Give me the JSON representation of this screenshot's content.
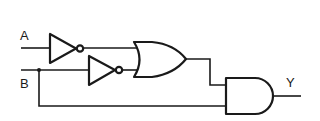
{
  "diagram": {
    "type": "logic-circuit",
    "inputs": [
      {
        "id": "A",
        "label": "A"
      },
      {
        "id": "B",
        "label": "B"
      }
    ],
    "outputs": [
      {
        "id": "Y",
        "label": "Y"
      }
    ],
    "gates": [
      {
        "id": "not1",
        "type": "NOT",
        "input": "A"
      },
      {
        "id": "not2",
        "type": "NOT",
        "input": "B"
      },
      {
        "id": "or1",
        "type": "OR",
        "inputs": [
          "not1",
          "not2"
        ]
      },
      {
        "id": "and1",
        "type": "AND",
        "inputs": [
          "or1",
          "B"
        ]
      }
    ],
    "expression": "Y = (A' + B') · B",
    "colors": {
      "stroke": "#1a1a1a",
      "background": "#ffffff"
    }
  }
}
